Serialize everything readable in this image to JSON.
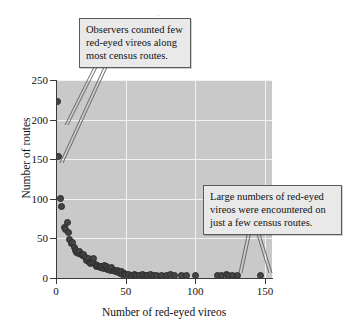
{
  "figure": {
    "background": "#ffffff",
    "plot_background": "#c9c9c9",
    "grid_color": "#f2f2f2",
    "marker_color": "#454545"
  },
  "annotations": [
    {
      "id": "top",
      "text": "Observers counted few red-eyed vireos along most census routes."
    },
    {
      "id": "bottom",
      "text": "Large numbers of red-eyed vireos were encountered on just a few census routes."
    }
  ],
  "chart_data": {
    "type": "scatter",
    "title": "",
    "xlabel": "Number of red-eyed vireos",
    "ylabel": "Number of routes",
    "xlim": [
      0,
      155
    ],
    "ylim": [
      0,
      250
    ],
    "xticks": [
      0,
      50,
      100,
      150
    ],
    "yticks": [
      0,
      50,
      100,
      150,
      200,
      250
    ],
    "grid": true,
    "legend": null,
    "annotations": [
      "Observers counted few red-eyed vireos along most census routes.",
      "Large numbers of red-eyed vireos were encountered on just a few census routes."
    ],
    "points": [
      [
        1,
        223
      ],
      [
        2,
        153
      ],
      [
        3,
        100
      ],
      [
        4,
        90
      ],
      [
        6,
        64
      ],
      [
        7,
        61
      ],
      [
        8,
        70
      ],
      [
        9,
        58
      ],
      [
        10,
        48
      ],
      [
        11,
        44
      ],
      [
        12,
        45
      ],
      [
        13,
        38
      ],
      [
        14,
        35
      ],
      [
        15,
        32
      ],
      [
        16,
        31
      ],
      [
        17,
        34
      ],
      [
        18,
        30
      ],
      [
        19,
        28
      ],
      [
        20,
        30
      ],
      [
        21,
        26
      ],
      [
        22,
        22
      ],
      [
        23,
        25
      ],
      [
        24,
        20
      ],
      [
        25,
        18
      ],
      [
        26,
        19
      ],
      [
        27,
        25
      ],
      [
        28,
        17
      ],
      [
        29,
        15
      ],
      [
        30,
        16
      ],
      [
        31,
        14
      ],
      [
        32,
        13
      ],
      [
        33,
        15
      ],
      [
        34,
        12
      ],
      [
        35,
        16
      ],
      [
        36,
        14
      ],
      [
        37,
        11
      ],
      [
        38,
        12
      ],
      [
        39,
        10
      ],
      [
        40,
        13
      ],
      [
        41,
        9
      ],
      [
        42,
        10
      ],
      [
        43,
        8
      ],
      [
        44,
        9
      ],
      [
        45,
        7
      ],
      [
        46,
        6
      ],
      [
        47,
        8
      ],
      [
        48,
        5
      ],
      [
        49,
        6
      ],
      [
        50,
        4
      ],
      [
        52,
        4
      ],
      [
        54,
        3
      ],
      [
        56,
        4
      ],
      [
        58,
        3
      ],
      [
        60,
        3
      ],
      [
        62,
        4
      ],
      [
        64,
        3
      ],
      [
        66,
        3
      ],
      [
        68,
        4
      ],
      [
        70,
        3
      ],
      [
        72,
        3
      ],
      [
        76,
        3
      ],
      [
        79,
        3
      ],
      [
        82,
        4
      ],
      [
        85,
        3
      ],
      [
        90,
        3
      ],
      [
        94,
        3
      ],
      [
        100,
        3
      ],
      [
        116,
        3
      ],
      [
        119,
        3
      ],
      [
        122,
        4
      ],
      [
        124,
        3
      ],
      [
        127,
        3
      ],
      [
        130,
        3
      ],
      [
        147,
        3
      ]
    ]
  }
}
